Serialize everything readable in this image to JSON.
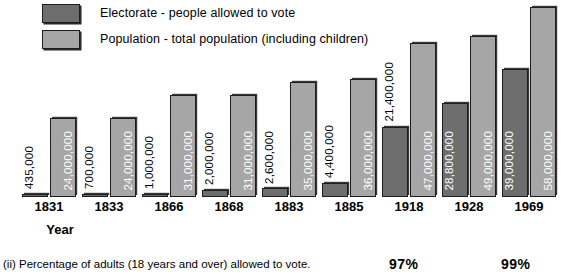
{
  "chart_data": {
    "type": "bar",
    "title": "",
    "xlabel": "Year",
    "ylabel": "",
    "ylim": [
      0,
      60000000
    ],
    "grid": false,
    "legend_position": "top-left",
    "categories": [
      "1831",
      "1833",
      "1866",
      "1868",
      "1883",
      "1885",
      "1918",
      "1928",
      "1969"
    ],
    "series": [
      {
        "name": "Electorate - people allowed to vote",
        "color": "#6e6e6e",
        "values": [
          435000,
          700000,
          1000000,
          2000000,
          2600000,
          4400000,
          21400000,
          28800000,
          39000000
        ],
        "labels": [
          "435,000",
          "700,000",
          "1,000,000",
          "2,000,000",
          "2,600,000",
          "4,400,000",
          "21,400,000",
          "28,800,000",
          "39,000,000"
        ]
      },
      {
        "name": "Population - total population (including children)",
        "color": "#a6a6a6",
        "values": [
          24000000,
          24000000,
          31000000,
          31000000,
          35000000,
          36000000,
          47000000,
          49000000,
          58000000
        ],
        "labels": [
          "24,000,000",
          "24,000,000",
          "31,000,000",
          "31,000,000",
          "35,000,000",
          "36,000,000",
          "47,000,000",
          "49,000,000",
          "58,000,000"
        ]
      }
    ],
    "annotations": [
      {
        "text": "97%",
        "category": "1918"
      },
      {
        "text": "99%",
        "category": "1969"
      }
    ]
  },
  "legend": {
    "items": [
      {
        "label": "Electorate - people allowed to vote",
        "color": "#6e6e6e"
      },
      {
        "label": "Population - total population (including children)",
        "color": "#a6a6a6"
      }
    ]
  },
  "axis": {
    "title": "Year"
  },
  "footer": {
    "caption": "(ii) Percentage of adults (18 years and over) allowed to vote."
  }
}
